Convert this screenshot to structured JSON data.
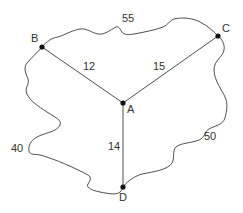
{
  "diagram": {
    "type": "graph",
    "nodes": [
      {
        "id": "A",
        "label": "A",
        "x": 123,
        "y": 103
      },
      {
        "id": "B",
        "label": "B",
        "x": 42,
        "y": 47
      },
      {
        "id": "C",
        "label": "C",
        "x": 218,
        "y": 36
      },
      {
        "id": "D",
        "label": "D",
        "x": 123,
        "y": 187
      }
    ],
    "edges": [
      {
        "from": "A",
        "to": "B",
        "weight": "12",
        "style": "straight"
      },
      {
        "from": "A",
        "to": "C",
        "weight": "15",
        "style": "straight"
      },
      {
        "from": "A",
        "to": "D",
        "weight": "14",
        "style": "straight"
      },
      {
        "from": "B",
        "to": "C",
        "weight": "55",
        "style": "wavy"
      },
      {
        "from": "B",
        "to": "D",
        "weight": "40",
        "style": "wavy"
      },
      {
        "from": "C",
        "to": "D",
        "weight": "50",
        "style": "wavy"
      }
    ]
  }
}
